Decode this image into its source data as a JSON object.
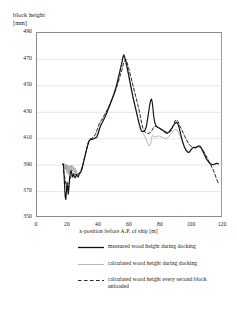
{
  "chart_data": {
    "type": "line",
    "title": "",
    "xlabel": "x-position before A.P. of ship [m]",
    "ylabel": "block height\n[mm]",
    "xlim": [
      0,
      120
    ],
    "ylim": [
      350,
      490
    ],
    "xticks": [
      0,
      20,
      40,
      60,
      80,
      100,
      120
    ],
    "yticks": [
      350,
      370,
      390,
      410,
      430,
      450,
      470,
      490
    ],
    "grid": "horizontal",
    "legend_position": "below",
    "series": [
      {
        "name": "measured wood height during docking",
        "style": "solid-thick",
        "color": "#111111",
        "x": [
          16.5,
          17.0,
          17.4,
          17.8,
          18.2,
          18.6,
          19.0,
          19.4,
          19.8,
          20.2,
          20.6,
          21.0,
          21.5,
          22.0,
          22.5,
          23.0,
          23.5,
          24.0,
          24.5,
          25.0,
          25.5,
          26.0,
          26.6,
          27.2,
          27.8,
          28.4,
          29.0,
          29.6,
          30.2,
          30.8,
          31.5,
          32.5,
          33.5,
          34.5,
          35.5,
          36.5,
          37.5,
          38.5,
          39.5,
          40.5,
          41.5,
          42.5,
          43.5,
          44.5,
          45.5,
          46.5,
          47.5,
          48.5,
          49.5,
          50.5,
          51.5,
          52.5,
          53.5,
          54.5,
          55.0,
          55.5,
          56.0,
          57.0,
          58.0,
          59.0,
          60.0,
          61.0,
          62.0,
          63.0,
          64.0,
          65.0,
          66.0,
          67.0,
          67.8,
          68.5,
          69.5,
          70.5,
          71.5,
          72.5,
          73.2,
          73.8,
          74.3,
          74.8,
          75.3,
          76.0,
          77.0,
          78.0,
          79.0,
          80.0,
          81.0,
          82.0,
          83.0,
          84.0,
          85.0,
          86.0,
          87.0,
          88.0,
          89.0,
          90.0,
          91.0,
          92.0,
          93.0,
          94.0,
          95.0,
          96.0,
          97.0,
          98.0,
          99.0,
          100.0,
          101.0,
          102.0,
          103.0,
          104.0,
          105.0,
          106.0,
          107.0,
          108.0,
          109.0,
          110.0,
          111.0,
          112.0,
          113.0,
          114.0,
          115.0,
          116.0,
          117.0
        ],
        "y": [
          390.5,
          391.0,
          384.0,
          374.0,
          366.0,
          364.0,
          370.0,
          377.0,
          372.0,
          368.0,
          373.0,
          380.0,
          384.0,
          386.0,
          383.0,
          381.0,
          383.0,
          382.0,
          380.5,
          381.0,
          383.0,
          382.0,
          381.0,
          383.0,
          384.0,
          385.0,
          387.0,
          390.0,
          393.0,
          396.0,
          399.5,
          404.0,
          408.0,
          409.5,
          409.5,
          410.0,
          410.5,
          411.0,
          414.0,
          418.0,
          421.0,
          423.0,
          425.5,
          428.0,
          431.0,
          434.0,
          437.0,
          440.0,
          443.0,
          447.0,
          451.0,
          456.0,
          461.0,
          466.0,
          469.0,
          472.0,
          473.5,
          470.0,
          465.0,
          459.0,
          453.0,
          447.0,
          441.0,
          436.0,
          431.0,
          426.0,
          421.0,
          417.0,
          415.5,
          415.5,
          416.0,
          419.0,
          426.0,
          434.0,
          438.5,
          440.0,
          438.0,
          433.0,
          427.0,
          422.0,
          419.5,
          418.5,
          418.0,
          417.0,
          416.5,
          415.5,
          414.5,
          414.0,
          415.0,
          416.5,
          418.0,
          420.0,
          421.5,
          422.5,
          421.0,
          417.0,
          412.0,
          407.5,
          404.0,
          401.5,
          400.0,
          399.5,
          401.0,
          402.5,
          403.5,
          403.0,
          403.5,
          404.5,
          404.5,
          403.0,
          400.5,
          398.0,
          395.5,
          393.5,
          392.0,
          391.0,
          390.5,
          390.5,
          391.0,
          391.5,
          391.0
        ]
      },
      {
        "name": "calculated wood height during docking",
        "style": "solid-thin",
        "color": "#9a9a9a",
        "x": [
          16.5,
          17.0,
          17.4,
          17.8,
          18.2,
          18.6,
          19.0,
          19.4,
          19.8,
          20.2,
          20.6,
          21.0,
          21.5,
          22.0,
          22.5,
          23.0,
          23.5,
          24.0,
          24.5,
          25.0,
          25.5,
          26.0,
          26.6,
          27.2,
          27.8,
          28.4,
          29.0,
          29.6,
          30.2,
          30.8,
          31.5,
          32.5,
          33.5,
          34.5,
          35.5,
          36.5,
          37.5,
          38.5,
          39.5,
          40.5,
          41.5,
          42.5,
          43.5,
          44.5,
          45.5,
          46.5,
          47.5,
          48.5,
          49.5,
          50.5,
          51.5,
          52.5,
          53.5,
          54.5,
          55.0,
          55.5,
          56.0,
          57.0,
          58.0,
          59.0,
          60.0,
          61.0,
          62.0,
          63.0,
          64.0,
          65.0,
          66.0,
          67.0,
          67.8,
          68.5,
          69.5,
          70.5,
          71.5,
          72.5,
          73.2,
          73.8,
          74.3,
          74.8,
          75.3,
          76.0,
          77.0,
          78.0,
          79.0,
          80.0,
          81.0,
          82.0,
          83.0,
          84.0,
          85.0,
          86.0,
          87.0,
          88.0,
          89.0,
          90.0,
          91.0,
          92.0,
          93.0,
          94.0,
          95.0,
          96.0,
          97.0,
          98.0,
          99.0,
          100.0,
          101.0,
          102.0,
          103.0,
          104.0,
          105.0,
          106.0,
          107.0,
          108.0,
          109.0,
          110.0,
          111.0,
          112.0,
          113.0,
          114.0,
          115.0,
          116.0,
          117.0
        ],
        "y": [
          391.0,
          390.0,
          391.0,
          387.0,
          391.0,
          386.0,
          390.5,
          384.0,
          390.0,
          383.0,
          389.5,
          384.0,
          390.0,
          386.0,
          390.0,
          385.0,
          389.0,
          384.5,
          388.0,
          384.0,
          386.0,
          383.0,
          384.0,
          384.0,
          385.0,
          386.0,
          388.0,
          391.0,
          394.0,
          397.0,
          400.0,
          404.5,
          408.5,
          410.0,
          410.0,
          410.5,
          411.0,
          412.0,
          416.0,
          420.0,
          423.0,
          425.0,
          427.0,
          429.5,
          432.0,
          435.0,
          438.0,
          441.0,
          444.5,
          448.0,
          452.0,
          457.0,
          462.0,
          467.0,
          470.0,
          472.5,
          472.0,
          468.0,
          463.0,
          457.5,
          452.0,
          446.0,
          440.5,
          435.0,
          430.0,
          425.0,
          420.0,
          416.0,
          414.5,
          414.0,
          412.0,
          409.0,
          406.0,
          404.5,
          406.0,
          409.5,
          412.0,
          412.5,
          412.0,
          411.5,
          411.5,
          412.0,
          412.0,
          411.5,
          411.0,
          410.5,
          410.0,
          410.5,
          411.5,
          413.0,
          414.5,
          416.0,
          417.0,
          417.0,
          415.5,
          413.0,
          410.0,
          407.0,
          404.5,
          402.0,
          400.5,
          400.0,
          401.0,
          402.5,
          403.5,
          403.0,
          403.5,
          404.0,
          404.0,
          402.5,
          400.0,
          397.5,
          395.0,
          393.0,
          391.5,
          390.5,
          390.0,
          390.0,
          390.5,
          391.0,
          390.5
        ]
      },
      {
        "name": "calculated wood height every second block\nunloaded",
        "style": "dashed",
        "color": "#2b2b2b",
        "x": [
          17.0,
          18.0,
          19.0,
          20.0,
          21.0,
          22.0,
          23.0,
          24.0,
          25.0,
          26.0,
          27.0,
          28.0,
          29.0,
          30.0,
          31.0,
          32.0,
          33.0,
          34.0,
          35.0,
          36.0,
          37.0,
          38.0,
          39.0,
          40.0,
          41.5,
          43.0,
          44.5,
          46.0,
          47.5,
          49.0,
          50.5,
          52.0,
          53.5,
          55.0,
          56.0,
          57.5,
          59.0,
          60.5,
          62.0,
          63.5,
          65.0,
          66.5,
          67.5,
          68.5,
          70.0,
          71.5,
          73.0,
          74.0,
          75.0,
          76.0,
          77.5,
          79.0,
          80.5,
          82.0,
          83.5,
          85.0,
          86.5,
          88.0,
          89.0,
          90.0,
          91.0,
          92.0,
          93.5,
          95.0,
          96.5,
          98.0,
          99.5,
          101.0,
          102.5,
          104.0,
          105.5,
          107.0,
          108.5,
          110.0,
          111.5,
          113.0,
          114.5,
          116.0,
          117.0
        ],
        "y": [
          386.0,
          380.0,
          373.0,
          371.0,
          378.0,
          382.0,
          383.5,
          383.5,
          383.0,
          383.0,
          383.5,
          385.0,
          388.0,
          392.0,
          397.0,
          402.0,
          407.0,
          409.5,
          410.0,
          411.0,
          412.0,
          414.0,
          417.5,
          421.0,
          424.0,
          427.0,
          430.0,
          433.5,
          437.5,
          441.5,
          446.0,
          451.0,
          457.0,
          463.0,
          468.0,
          470.0,
          464.0,
          457.0,
          450.0,
          443.0,
          436.0,
          428.0,
          422.0,
          417.0,
          414.5,
          414.0,
          414.5,
          416.0,
          418.0,
          419.5,
          419.0,
          418.0,
          417.0,
          416.0,
          415.0,
          414.5,
          416.0,
          420.0,
          423.5,
          424.5,
          423.0,
          420.0,
          416.5,
          412.5,
          409.0,
          406.0,
          404.0,
          403.5,
          403.5,
          404.0,
          403.5,
          401.5,
          398.5,
          395.0,
          391.5,
          388.0,
          384.0,
          379.0,
          376.5
        ]
      }
    ]
  }
}
